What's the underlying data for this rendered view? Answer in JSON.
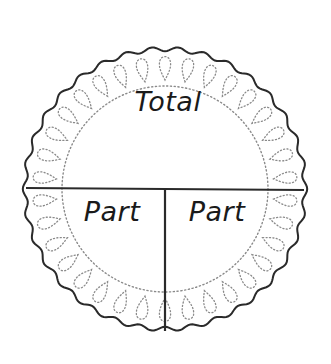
{
  "diagram": {
    "type": "part-part-whole",
    "shape": "scalloped-circle",
    "labels": {
      "total": "Total",
      "part_left": "Part",
      "part_right": "Part"
    },
    "geometry": {
      "cx": 165,
      "cy": 189,
      "outer_r": 140,
      "inner_dotted_r": 103,
      "scallops": 34,
      "divider_y": 189
    },
    "colors": {
      "stroke": "#2a2a2a",
      "dotted": "#8a8a8a",
      "background": "#ffffff"
    }
  }
}
